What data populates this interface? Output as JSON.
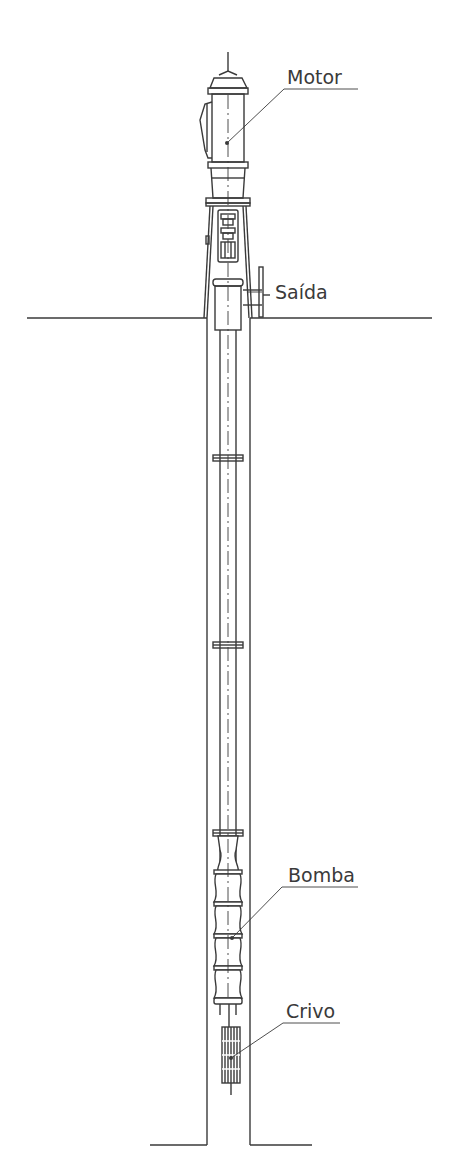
{
  "diagram": {
    "type": "vertical turbine well pump",
    "labels": {
      "motor": "Motor",
      "saida": "Saída",
      "bomba": "Bomba",
      "crivo": "Crivo"
    },
    "colors": {
      "line": "#3a3a3a",
      "text": "#3a3a3a",
      "background": "#ffffff"
    }
  }
}
